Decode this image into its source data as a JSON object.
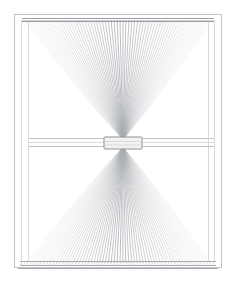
{
  "artwork": {
    "title": "Window with Tied Sheer Curtain",
    "medium": "pencil sketch",
    "subject": "window-curtain",
    "background_color": "#ffffff",
    "line_color": "#9a9da2",
    "canvas": {
      "width": 246,
      "height": 281
    }
  },
  "scene": {
    "window_frame": {
      "name": "window-frame",
      "outer": {
        "x": 14,
        "y": 14,
        "width": 208,
        "height": 254
      },
      "inner": {
        "x": 21,
        "y": 20,
        "width": 194,
        "height": 242
      },
      "stile_lines_x": [
        14,
        21,
        28,
        208,
        215,
        222
      ],
      "color": "#b9bcc0"
    },
    "curtain_rod": {
      "name": "curtain-rod",
      "y": 19,
      "x_start": 22,
      "x_end": 214,
      "color": "#8e9196"
    },
    "mid_rail": {
      "name": "window-mid-rail",
      "y_top": 138,
      "y_bottom": 147,
      "x_start": 29,
      "x_end": 214,
      "color": "#aeb1b6"
    },
    "sill": {
      "name": "window-sill",
      "y_top": 261,
      "y_bottom": 269,
      "x_start": 20,
      "x_end": 216,
      "color": "#a7aaaf"
    },
    "curtain": {
      "name": "sheer-curtain",
      "shape": "hourglass",
      "tie_band": {
        "name": "curtain-tie-band",
        "x": 104,
        "y": 137,
        "width": 38,
        "height": 12,
        "fill": "#f2f2f3",
        "stroke": "#8e9196"
      },
      "upper_fan": {
        "apex_x": 123,
        "apex_y": 140,
        "top_y": 20,
        "top_x_start": 25,
        "top_x_end": 212,
        "strand_count": 64
      },
      "lower_fan": {
        "apex_x": 123,
        "apex_y": 147,
        "bottom_y": 263,
        "bottom_x_start": 27,
        "bottom_x_end": 210,
        "strand_count": 64
      },
      "stroke_color": "#a8abb0"
    }
  }
}
